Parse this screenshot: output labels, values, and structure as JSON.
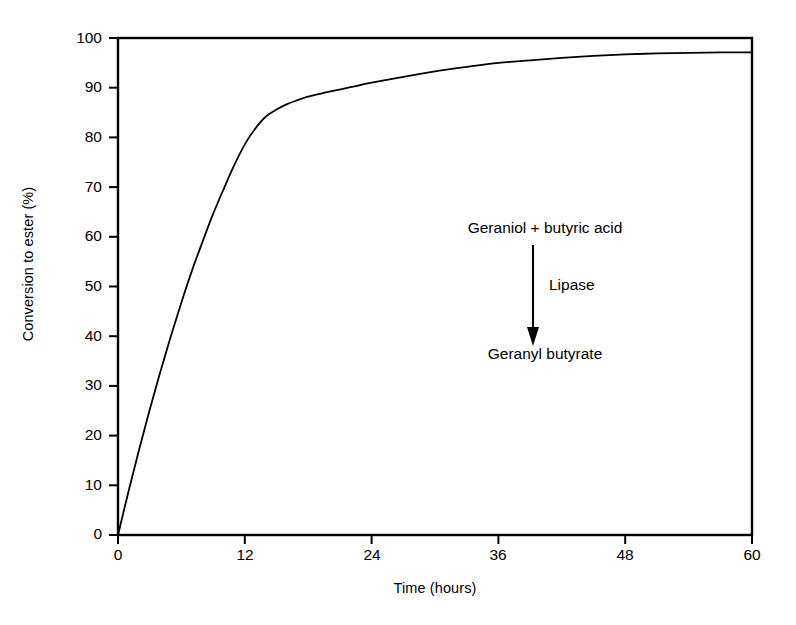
{
  "chart_data": {
    "type": "line",
    "title": "",
    "xlabel": "Time (hours)",
    "ylabel": "Conversion to ester (%)",
    "xlim": [
      0,
      60
    ],
    "ylim": [
      0,
      100
    ],
    "xticks": [
      0,
      12,
      24,
      36,
      48,
      60
    ],
    "yticks": [
      0,
      10,
      20,
      30,
      40,
      50,
      60,
      70,
      80,
      90,
      100
    ],
    "xtick_labels": [
      "0",
      "12",
      "24",
      "36",
      "48",
      "60"
    ],
    "ytick_labels": [
      "0",
      "10",
      "20",
      "30",
      "40",
      "50",
      "60",
      "70",
      "80",
      "90",
      "100"
    ],
    "grid": false,
    "legend": false,
    "frame": "box",
    "series": [
      {
        "name": "Conversion to ester",
        "color": "#000000",
        "linewidth": 1.8,
        "markers": false,
        "x": [
          0,
          1,
          2,
          3,
          4,
          5,
          6,
          7,
          8,
          9,
          10,
          11,
          12,
          13,
          14,
          15,
          16,
          17,
          18,
          19,
          20,
          22,
          24,
          27,
          30,
          33,
          36,
          39,
          42,
          45,
          48,
          51,
          54,
          57,
          60
        ],
        "y": [
          0,
          8.8,
          17.2,
          25.2,
          32.8,
          40.0,
          46.8,
          53.2,
          59.0,
          64.6,
          69.6,
          74.4,
          78.6,
          81.8,
          84.2,
          85.6,
          86.7,
          87.5,
          88.2,
          88.7,
          89.2,
          90.1,
          91.0,
          92.2,
          93.3,
          94.2,
          95.0,
          95.5,
          96.0,
          96.4,
          96.7,
          96.9,
          97.0,
          97.1,
          97.1
        ]
      }
    ],
    "annotations": {
      "reactant": "Geraniol + butyric acid",
      "enzyme": "Lipase",
      "product": "Geranyl butyrate",
      "arrow": "down-arrow"
    }
  },
  "axes": {
    "y_label": "Conversion to ester (%)",
    "x_label": "Time (hours)"
  },
  "colors": {
    "background": "#ffffff",
    "ink": "#000000",
    "curve": "#000000"
  }
}
